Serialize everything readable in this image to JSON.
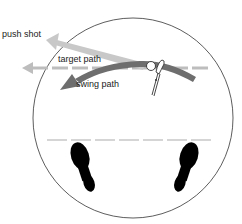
{
  "diagram": {
    "labels": {
      "push_shot": "push shot",
      "target_path": "target path",
      "swing_path": "swing path"
    },
    "elements": [
      {
        "name": "stance-circle",
        "shape": "circle",
        "stroke": "#333333"
      },
      {
        "name": "target-line",
        "style": "dashed",
        "color": "#bdbdbd",
        "direction": "left"
      },
      {
        "name": "push-shot-arrow",
        "color": "#c8c8c8",
        "direction": "up-left"
      },
      {
        "name": "swing-path-arrow",
        "color": "#6e6e6e",
        "direction": "in-to-out curve"
      },
      {
        "name": "ball",
        "shape": "circle"
      },
      {
        "name": "club",
        "shape": "club-head-and-shaft"
      },
      {
        "name": "foot-line",
        "style": "dashed",
        "color": "#c8c8c8"
      },
      {
        "name": "left-footprint",
        "color": "#000000"
      },
      {
        "name": "right-footprint",
        "color": "#000000"
      }
    ],
    "colors": {
      "circle": "#333333",
      "target_line": "#bdbdbd",
      "push_arrow": "#c8c8c8",
      "swing_arrow": "#6e6e6e",
      "feet": "#000000"
    }
  }
}
